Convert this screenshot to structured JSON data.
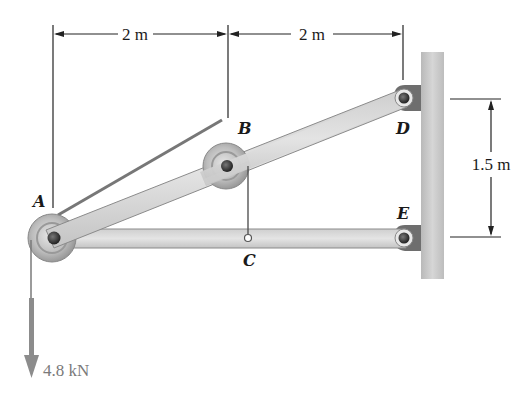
{
  "figure": {
    "type": "statics-frame-with-pulleys",
    "points": {
      "A": {
        "label": "A"
      },
      "B": {
        "label": "B"
      },
      "C": {
        "label": "C"
      },
      "D": {
        "label": "D"
      },
      "E": {
        "label": "E"
      }
    },
    "dimensions": {
      "horizontal_AB": "2 m",
      "horizontal_BD": "2 m",
      "vertical_DE": "1.5 m"
    },
    "load": {
      "label": "4.8 kN",
      "direction": "down",
      "applied_at": "A"
    },
    "colors": {
      "member_fill": "#dcdcdc",
      "member_edge": "#8a8a8a",
      "wall": "#c8c8c8",
      "pulley": "#b8b8b8",
      "pin": "#3a3a3a",
      "force_arrow": "#8c8c8c",
      "text": "#1a1a1a"
    }
  }
}
